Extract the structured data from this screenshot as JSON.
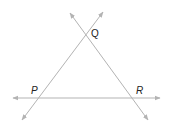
{
  "diagram": {
    "type": "three intersecting lines",
    "line_color": "#b3b3b3",
    "label_color": "#222222",
    "points": [
      {
        "id": "P",
        "label": "P",
        "x": 38,
        "y": 98,
        "label_x": 31,
        "label_y": 94
      },
      {
        "id": "Q",
        "label": "Q",
        "x": 87,
        "y": 35,
        "label_x": 91,
        "label_y": 37
      },
      {
        "id": "R",
        "label": "R",
        "x": 135,
        "y": 98,
        "label_x": 136,
        "label_y": 94
      }
    ],
    "lines": [
      {
        "name": "line-PR",
        "through": [
          "P",
          "R"
        ],
        "from": [
          13,
          98
        ],
        "to": [
          160,
          98
        ]
      },
      {
        "name": "line-PQ",
        "through": [
          "P",
          "Q"
        ],
        "from": [
          22,
          120
        ],
        "to": [
          103,
          12
        ]
      },
      {
        "name": "line-QR",
        "through": [
          "Q",
          "R"
        ],
        "from": [
          70,
          13
        ],
        "to": [
          148,
          120
        ]
      }
    ]
  }
}
